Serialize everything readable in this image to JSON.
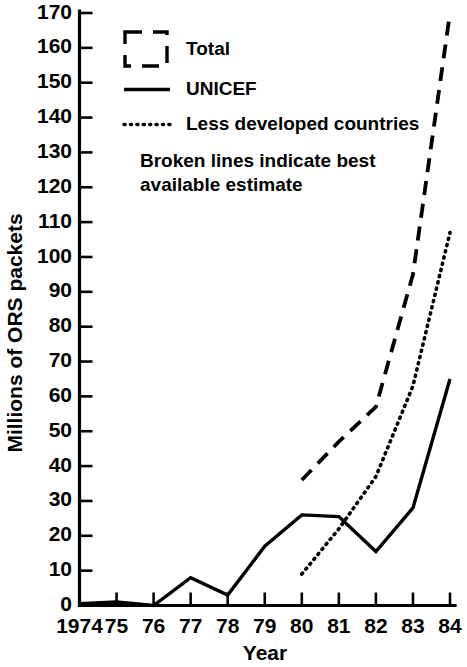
{
  "chart_data": {
    "type": "line",
    "title": "",
    "xlabel": "Year",
    "ylabel": "Millions of ORS packets",
    "x": [
      1974,
      1975,
      1976,
      1977,
      1978,
      1979,
      1980,
      1981,
      1982,
      1983,
      1984
    ],
    "xtick_labels": [
      "1974",
      "75",
      "76",
      "77",
      "78",
      "79",
      "80",
      "81",
      "82",
      "83",
      "84"
    ],
    "ytick_labels": [
      "0",
      "10",
      "20",
      "30",
      "40",
      "50",
      "60",
      "70",
      "80",
      "90",
      "100",
      "110",
      "120",
      "130",
      "140",
      "150",
      "160",
      "170"
    ],
    "ytick_values": [
      0,
      10,
      20,
      30,
      40,
      50,
      60,
      70,
      80,
      90,
      100,
      110,
      120,
      130,
      140,
      150,
      160,
      170
    ],
    "xlim": [
      1974,
      1984
    ],
    "ylim": [
      0,
      170
    ],
    "grid": false,
    "legend_position": "upper-left",
    "series": [
      {
        "name": "Total",
        "style": "dashed",
        "x": [
          1980,
          1981,
          1982,
          1983,
          1984
        ],
        "values": [
          36,
          47,
          57,
          95,
          170
        ]
      },
      {
        "name": "UNICEF",
        "style": "solid",
        "x": [
          1974,
          1975,
          1976,
          1977,
          1978,
          1979,
          1980,
          1981,
          1982,
          1983,
          1984
        ],
        "values": [
          0.5,
          1,
          0,
          8,
          3,
          17,
          26,
          25.5,
          15.5,
          28,
          65
        ]
      },
      {
        "name": "Less developed countries",
        "style": "dotted",
        "x": [
          1980,
          1981,
          1982,
          1983,
          1984
        ],
        "values": [
          9,
          22,
          37,
          63,
          107
        ]
      }
    ],
    "annotations": [
      "Broken lines indicate best available estimate"
    ]
  },
  "legend": {
    "items": [
      {
        "label": "Total",
        "symbol": "dashed-box-icon"
      },
      {
        "label": "UNICEF",
        "symbol": "solid-line-icon"
      },
      {
        "label": "Less developed countries",
        "symbol": "dotted-line-icon"
      }
    ],
    "note_line_1": "Broken lines indicate best",
    "note_line_2": "available estimate"
  },
  "axes": {
    "y_title": "Millions of ORS packets",
    "x_title": "Year"
  },
  "colors": {
    "ink": "#000000",
    "background": "#ffffff"
  }
}
